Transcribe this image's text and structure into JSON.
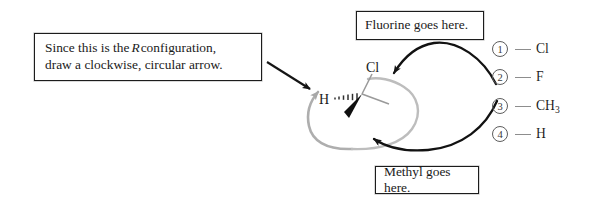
{
  "callouts": {
    "configuration": {
      "line1_prefix": "Since this is the",
      "line1_italic": "R",
      "line1_suffix": "configuration,",
      "line2": "draw a clockwise, circular arrow."
    },
    "fluorine": {
      "text": "Fluorine goes here."
    },
    "methyl": {
      "text": "Methyl goes here."
    }
  },
  "molecule": {
    "labels": {
      "chlorine": "Cl",
      "hydrogen": "H"
    },
    "bonds": {
      "chlorine_bond": "plain-bond-up",
      "hydrogen_bond": "hashed-wedge-bond",
      "wedge_bond": "bold-wedge-bond-down-left",
      "plain_bond": "plain-bond-down-right"
    }
  },
  "priority_list": {
    "rows": [
      {
        "rank": "1",
        "label": "Cl",
        "sub": ""
      },
      {
        "rank": "2",
        "label": "F",
        "sub": ""
      },
      {
        "rank": "3",
        "label": "CH",
        "sub": "3"
      },
      {
        "rank": "4",
        "label": "H",
        "sub": ""
      }
    ]
  },
  "arrows": {
    "pointer_to_circle": "straight-black-arrow",
    "circular_arrow": "gray-counterclockwise-circular-arrow",
    "fluorine_arrow": "curved-black-arrow-to-molecule",
    "methyl_arrow": "curved-black-arrow-to-molecule"
  },
  "colors": {
    "ink": "#1c1c1c",
    "gray_arrow": "#a8a8a8",
    "bond_gray": "#9a9a9a",
    "circle_stroke": "#5d5d5d",
    "background": "#ffffff"
  }
}
